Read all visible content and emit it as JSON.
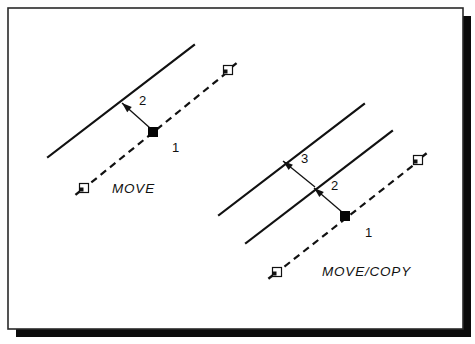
{
  "figure": {
    "background_color": "#ffffff",
    "ink_color": "#111111",
    "shadow_color": "#0b0b0b",
    "frame": {
      "x": 8,
      "y": 8,
      "width": 455,
      "height": 321,
      "shadow_offset": 8
    }
  },
  "diagrams": [
    {
      "id": "move",
      "caption": "MOVE",
      "caption_pos": {
        "x": 112,
        "y": 193
      },
      "original_line": {
        "name": "destination-line",
        "x1": 48,
        "y1": 157,
        "x2": 194,
        "y2": 45,
        "style": "solid"
      },
      "displacement_line": {
        "name": "displacement-vector",
        "x1": 82,
        "y1": 190,
        "x2": 230,
        "y2": 70,
        "style": "dashed"
      },
      "base_point": {
        "x": 153,
        "y": 132,
        "size": 9,
        "label": "1"
      },
      "base_label_pos": {
        "x": 172,
        "y": 152
      },
      "cursor_start": {
        "x": 84,
        "y": 188
      },
      "cursor_end": {
        "x": 228,
        "y": 70
      },
      "leaders": [
        {
          "label": "2",
          "from": {
            "x": 150,
            "y": 128
          },
          "to": {
            "x": 122,
            "y": 103
          },
          "label_pos": {
            "x": 139,
            "y": 105
          },
          "target": "destination-line"
        }
      ]
    },
    {
      "id": "move-copy",
      "caption": "MOVE/COPY",
      "caption_pos": {
        "x": 322,
        "y": 276
      },
      "original_line": {
        "name": "first-destination-line",
        "x1": 219,
        "y1": 215,
        "x2": 364,
        "y2": 104,
        "style": "solid"
      },
      "second_line": {
        "name": "second-destination-line",
        "x1": 246,
        "y1": 243,
        "x2": 392,
        "y2": 131,
        "style": "solid"
      },
      "displacement_line": {
        "name": "displacement-vector",
        "x1": 275,
        "y1": 274,
        "x2": 420,
        "y2": 160,
        "style": "dashed"
      },
      "base_point": {
        "x": 345,
        "y": 216,
        "size": 9,
        "label": "1"
      },
      "base_label_pos": {
        "x": 365,
        "y": 237
      },
      "cursor_start": {
        "x": 277,
        "y": 272
      },
      "cursor_end": {
        "x": 418,
        "y": 160
      },
      "leaders": [
        {
          "label": "2",
          "from": {
            "x": 342,
            "y": 212
          },
          "to": {
            "x": 314,
            "y": 188
          },
          "label_pos": {
            "x": 331,
            "y": 190
          },
          "target": "second-destination-line"
        },
        {
          "label": "3",
          "from": {
            "x": 315,
            "y": 187
          },
          "to": {
            "x": 283,
            "y": 161
          },
          "label_pos": {
            "x": 301,
            "y": 163
          },
          "target": "first-destination-line"
        }
      ]
    }
  ]
}
